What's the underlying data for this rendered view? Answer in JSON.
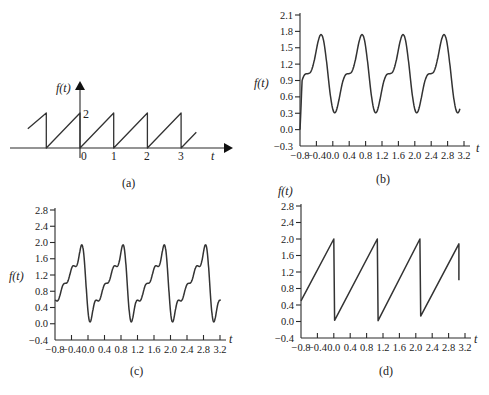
{
  "colors": {
    "line": "#333333",
    "axis": "#2a2a2a",
    "background": "#ffffff"
  },
  "chart_data": [
    {
      "id": "a",
      "type": "line",
      "caption": "(a)",
      "title": "",
      "xlabel": "t",
      "ylabel": "f(t)",
      "x_ticks": [
        "0",
        "1",
        "2",
        "3"
      ],
      "y_ticks": [
        "2"
      ],
      "description": "Ideal sawtooth, period 1, rising 0 to 2 then dropping",
      "series": [
        {
          "name": "f(t)",
          "x": [
            -1.55,
            -1,
            -1,
            0,
            0,
            1,
            1,
            2,
            2,
            3,
            3,
            3.45
          ],
          "y": [
            1.1,
            2,
            0,
            2,
            0,
            2,
            0,
            2,
            0,
            2,
            0,
            0.9
          ]
        }
      ],
      "grid": false
    },
    {
      "id": "b",
      "type": "line",
      "caption": "(b)",
      "xlabel": "t",
      "ylabel": "f(t)",
      "x_ticks": [
        "-0.8",
        "-0.4",
        "0.0",
        "0.4",
        "0.8",
        "1.2",
        "1.6",
        "2.0",
        "2.4",
        "2.8",
        "3.2"
      ],
      "y_ticks": [
        "-0.3",
        "0.0",
        "0.3",
        "0.6",
        "0.9",
        "1.2",
        "1.5",
        "1.8",
        "2.1"
      ],
      "xlim": [
        -0.8,
        3.2
      ],
      "ylim": [
        -0.3,
        2.1
      ],
      "description": "Truncated Fourier series approximation (few harmonics); peaks ~1.85, troughs ~0.2",
      "series": [
        {
          "name": "f(t)",
          "harmonics": 2,
          "x_range": [
            -0.8,
            3.1
          ],
          "peak": 1.85,
          "trough": 0.2
        }
      ],
      "grid": false
    },
    {
      "id": "c",
      "type": "line",
      "caption": "(c)",
      "xlabel": "t",
      "ylabel": "f(t)",
      "x_ticks": [
        "-0.8",
        "-0.4",
        "0.0",
        "0.4",
        "0.8",
        "1.2",
        "1.6",
        "2.0",
        "2.4",
        "2.8",
        "3.2"
      ],
      "y_ticks": [
        "-0.4",
        "0.0",
        "0.4",
        "0.8",
        "1.2",
        "1.6",
        "2.0",
        "2.4",
        "2.8"
      ],
      "xlim": [
        -0.8,
        3.2
      ],
      "ylim": [
        -0.4,
        2.8
      ],
      "description": "Truncated Fourier series approximation (more harmonics); peaks ~2.0, troughs ~0.0",
      "series": [
        {
          "name": "f(t)",
          "harmonics": 4,
          "x_range": [
            -0.8,
            3.22
          ],
          "peak": 2.0,
          "trough": 0.0
        }
      ],
      "grid": false
    },
    {
      "id": "d",
      "type": "line",
      "caption": "(d)",
      "xlabel": "t",
      "ylabel": "f(t)",
      "x_ticks": [
        "-0.8",
        "-0.4",
        "0.0",
        "0.4",
        "0.8",
        "1.2",
        "1.6",
        "2.0",
        "2.4",
        "2.8",
        "3.2"
      ],
      "y_ticks": [
        "-0.4",
        "0.0",
        "0.4",
        "0.8",
        "1.2",
        "1.6",
        "2.0",
        "2.4",
        "2.8"
      ],
      "xlim": [
        -0.8,
        3.2
      ],
      "ylim": [
        -0.4,
        2.8
      ],
      "description": "Sampled sawtooth with slight drift",
      "series": [
        {
          "name": "f(t)",
          "x": [
            -0.8,
            0.0,
            0.02,
            1.06,
            1.08,
            2.1,
            2.12,
            3.05,
            3.05
          ],
          "y": [
            0.5,
            2.0,
            0.03,
            2.0,
            0.02,
            2.0,
            0.13,
            1.88,
            1.0
          ]
        }
      ],
      "grid": false
    }
  ],
  "labels": {
    "a": {
      "ylabel": "f(t)",
      "xlabel": "t",
      "tick0": "0",
      "tick1": "1",
      "tick2": "2",
      "tick3": "3",
      "ytick": "2",
      "caption": "(a)"
    },
    "b": {
      "ylabel": "f(t)",
      "xlabel": "t",
      "caption": "(b)"
    },
    "c": {
      "ylabel": "f(t)",
      "xlabel": "t",
      "caption": "(c)"
    },
    "d": {
      "ylabel": "f(t)",
      "xlabel": "t",
      "caption": "(d)"
    }
  }
}
